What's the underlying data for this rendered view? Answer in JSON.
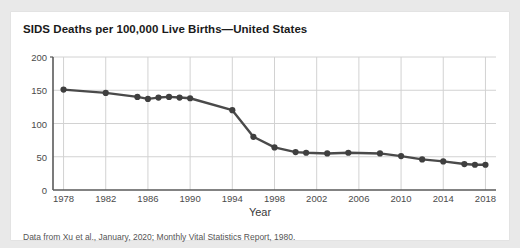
{
  "chart_data": {
    "type": "line",
    "title": "SIDS Deaths per 100,000 Live Births—United States",
    "xlabel": "Year",
    "ylabel": "",
    "xlim": [
      1977,
      2019
    ],
    "ylim": [
      0,
      200
    ],
    "grid": true,
    "legend": null,
    "line_color": "#4a4a4a",
    "marker_color": "#3f3f3f",
    "caption": "Data from Xu et al., January, 2020; Monthly Vital Statistics Report, 1980.",
    "ytick_labels": [
      "0",
      "50",
      "100",
      "150",
      "200"
    ],
    "ytick_values": [
      0,
      50,
      100,
      150,
      200
    ],
    "xtick_labels": [
      "1978",
      "1982",
      "1986",
      "1990",
      "1994",
      "1998",
      "2002",
      "2006",
      "2010",
      "2014",
      "2018"
    ],
    "xtick_values": [
      1978,
      1982,
      1986,
      1990,
      1994,
      1998,
      2002,
      2006,
      2010,
      2014,
      2018
    ],
    "x": [
      1978,
      1982,
      1985,
      1986,
      1987,
      1988,
      1989,
      1990,
      1994,
      1996,
      1998,
      2000,
      2001,
      2003,
      2005,
      2008,
      2010,
      2012,
      2014,
      2016,
      2017,
      2018
    ],
    "values": [
      151,
      146,
      140,
      137,
      139,
      140,
      139,
      138,
      120,
      80,
      64,
      57,
      56,
      55,
      56,
      55,
      51,
      46,
      43,
      39,
      38,
      38
    ],
    "series": [
      {
        "name": "SIDS deaths per 100,000 live births",
        "points": [
          {
            "x": 1978,
            "y": 151
          },
          {
            "x": 1982,
            "y": 146
          },
          {
            "x": 1985,
            "y": 140
          },
          {
            "x": 1986,
            "y": 137
          },
          {
            "x": 1987,
            "y": 139
          },
          {
            "x": 1988,
            "y": 140
          },
          {
            "x": 1989,
            "y": 139
          },
          {
            "x": 1990,
            "y": 138
          },
          {
            "x": 1994,
            "y": 120
          },
          {
            "x": 1996,
            "y": 80
          },
          {
            "x": 1998,
            "y": 64
          },
          {
            "x": 2000,
            "y": 57
          },
          {
            "x": 2001,
            "y": 56
          },
          {
            "x": 2003,
            "y": 55
          },
          {
            "x": 2005,
            "y": 56
          },
          {
            "x": 2008,
            "y": 55
          },
          {
            "x": 2010,
            "y": 51
          },
          {
            "x": 2012,
            "y": 46
          },
          {
            "x": 2014,
            "y": 43
          },
          {
            "x": 2016,
            "y": 39
          },
          {
            "x": 2017,
            "y": 38
          },
          {
            "x": 2018,
            "y": 38
          }
        ]
      }
    ]
  }
}
